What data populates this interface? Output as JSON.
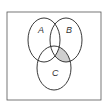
{
  "diagram": {
    "type": "venn",
    "sets": [
      {
        "id": "A",
        "label": "A"
      },
      {
        "id": "B",
        "label": "B"
      },
      {
        "id": "C",
        "label": "C"
      }
    ],
    "shaded_region": "B ∩ C ∩ A'",
    "colors": {
      "stroke": "#222222",
      "shade": "#cfcfcf",
      "universe_border": "#555555",
      "background": "#ffffff"
    }
  }
}
